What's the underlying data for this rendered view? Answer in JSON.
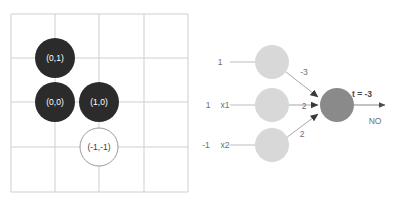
{
  "colors": {
    "grid_line": "#cfcfcf",
    "point_filled": "#2b2b2b",
    "point_open_stroke": "#9a9a9a",
    "point_label_light": "#ffffff",
    "point_label_dark": "#3a3a3a",
    "node_input": "#d8d8d8",
    "node_output": "#8a8a8a",
    "edge": "#a8a8a8",
    "text": "#6e6e6e",
    "text_bold": "#4a4a4a",
    "background": "#ffffff"
  },
  "plot": {
    "name": "boolean-function-plot",
    "grid": {
      "x_lines": [
        11,
        55,
        99,
        144,
        188
      ],
      "y_lines": [
        14,
        58,
        102,
        147,
        192
      ],
      "show": true
    },
    "points": [
      {
        "label": "(0,1)",
        "cx": 55,
        "cy": 58,
        "r": 20,
        "filled": true
      },
      {
        "label": "(0,0)",
        "cx": 55,
        "cy": 102,
        "r": 20,
        "filled": true
      },
      {
        "label": "(1,0)",
        "cx": 99,
        "cy": 102,
        "r": 20,
        "filled": true
      },
      {
        "label": "(-1,-1)",
        "cx": 99,
        "cy": 147,
        "r": 19,
        "filled": false
      }
    ]
  },
  "network": {
    "name": "perceptron-diagram",
    "inputs": [
      {
        "value_label": "1",
        "name_label": "",
        "cx": 72,
        "cy": 62,
        "r": 17,
        "weight": "-3"
      },
      {
        "value_label": "1",
        "name_label": "x1",
        "cx": 72,
        "cy": 105,
        "r": 17,
        "weight": "2"
      },
      {
        "value_label": "-1",
        "name_label": "x2",
        "cx": 72,
        "cy": 145,
        "r": 17,
        "weight": "2"
      }
    ],
    "output_node": {
      "cx": 137,
      "cy": 105,
      "r": 17
    },
    "output": {
      "total_label": "t = -3",
      "decision_label": "NO"
    },
    "weight_positions": [
      {
        "x": 104,
        "y": 72
      },
      {
        "x": 104,
        "y": 109
      },
      {
        "x": 102,
        "y": 134
      }
    ]
  }
}
